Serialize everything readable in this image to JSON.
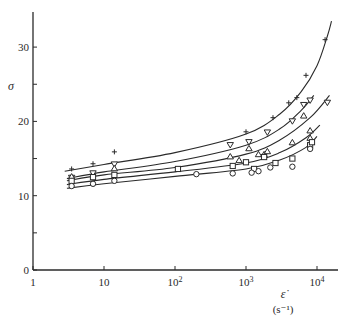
{
  "chart_data": {
    "type": "scatter",
    "title": "",
    "xlabel": "ε̇",
    "xlabel_unit": "(s⁻¹)",
    "ylabel": "σ",
    "xscale": "log",
    "xlim": [
      1,
      20000
    ],
    "ylim": [
      0,
      35
    ],
    "x_ticks": [
      {
        "value": 1,
        "label": "1"
      },
      {
        "value": 10,
        "label": "10"
      },
      {
        "value": 100,
        "label": "10",
        "sup": "2"
      },
      {
        "value": 1000,
        "label": "10",
        "sup": "3"
      },
      {
        "value": 10000,
        "label": "10",
        "sup": "4"
      }
    ],
    "y_ticks": [
      {
        "value": 0,
        "label": "0"
      },
      {
        "value": 5,
        "label": ""
      },
      {
        "value": 10,
        "label": "10"
      },
      {
        "value": 15,
        "label": ""
      },
      {
        "value": 20,
        "label": "20"
      },
      {
        "value": 25,
        "label": ""
      },
      {
        "value": 30,
        "label": "30"
      }
    ],
    "grid": false,
    "legend": "none",
    "series": [
      {
        "name": "plus",
        "marker": "+",
        "points": [
          [
            3.5,
            13.6
          ],
          [
            7,
            14.3
          ],
          [
            14,
            15.9
          ],
          [
            1000,
            18.6
          ],
          [
            2400,
            20.5
          ],
          [
            4000,
            22.5
          ],
          [
            5200,
            23.2
          ],
          [
            7000,
            26.2
          ],
          [
            13000,
            31.0
          ]
        ],
        "curve": [
          [
            2.8,
            13.3
          ],
          [
            10,
            14.2
          ],
          [
            100,
            15.8
          ],
          [
            1000,
            18.3
          ],
          [
            3000,
            21.0
          ],
          [
            6000,
            24.0
          ],
          [
            10000,
            27.5
          ],
          [
            14000,
            31.5
          ],
          [
            16000,
            33.5
          ]
        ]
      },
      {
        "name": "down-triangle",
        "marker": "▽",
        "points": [
          [
            3.5,
            12.4
          ],
          [
            7,
            13.0
          ],
          [
            14,
            14.2
          ],
          [
            600,
            16.8
          ],
          [
            1100,
            17.2
          ],
          [
            2000,
            18.5
          ],
          [
            4500,
            20.0
          ],
          [
            6500,
            22.2
          ],
          [
            8000,
            22.8
          ],
          [
            14000,
            22.5
          ]
        ],
        "curve": [
          [
            3,
            12.3
          ],
          [
            10,
            13.2
          ],
          [
            100,
            14.6
          ],
          [
            1000,
            16.8
          ],
          [
            3000,
            19.0
          ],
          [
            6000,
            21.5
          ],
          [
            9000,
            23.5
          ]
        ]
      },
      {
        "name": "up-triangle",
        "marker": "△",
        "points": [
          [
            3.5,
            12.6
          ],
          [
            14,
            13.7
          ],
          [
            600,
            15.3
          ],
          [
            800,
            14.8
          ],
          [
            1100,
            16.4
          ],
          [
            1500,
            15.6
          ],
          [
            1800,
            15.6
          ],
          [
            2000,
            16.0
          ],
          [
            4500,
            17.2
          ],
          [
            6500,
            20.8
          ],
          [
            8000,
            18.8
          ],
          [
            8000,
            17.8
          ]
        ],
        "curve": [
          [
            3,
            12.0
          ],
          [
            10,
            12.8
          ],
          [
            100,
            13.8
          ],
          [
            1000,
            15.6
          ],
          [
            3000,
            17.5
          ],
          [
            8000,
            20.5
          ],
          [
            15000,
            23.5
          ]
        ]
      },
      {
        "name": "square",
        "marker": "□",
        "points": [
          [
            3.5,
            12.0
          ],
          [
            7,
            12.5
          ],
          [
            14,
            12.8
          ],
          [
            110,
            13.6
          ],
          [
            650,
            14.0
          ],
          [
            1000,
            14.5
          ],
          [
            1300,
            13.6
          ],
          [
            1800,
            15.2
          ],
          [
            2600,
            14.4
          ],
          [
            4500,
            15.0
          ],
          [
            8000,
            16.8
          ],
          [
            8500,
            17.2
          ]
        ],
        "curve": [
          [
            3,
            11.5
          ],
          [
            10,
            12.2
          ],
          [
            100,
            13.2
          ],
          [
            1000,
            14.4
          ],
          [
            3000,
            15.8
          ],
          [
            7000,
            17.8
          ],
          [
            11000,
            19.5
          ]
        ]
      },
      {
        "name": "circle",
        "marker": "○",
        "points": [
          [
            3.5,
            11.3
          ],
          [
            7,
            11.6
          ],
          [
            14,
            12.0
          ],
          [
            200,
            12.9
          ],
          [
            650,
            13.0
          ],
          [
            1200,
            13.1
          ],
          [
            1500,
            13.3
          ],
          [
            2200,
            13.8
          ],
          [
            4500,
            13.9
          ],
          [
            8000,
            16.3
          ]
        ],
        "curve": [
          [
            3,
            11.0
          ],
          [
            10,
            11.6
          ],
          [
            100,
            12.6
          ],
          [
            1000,
            13.6
          ],
          [
            3000,
            14.8
          ],
          [
            7000,
            16.5
          ],
          [
            10000,
            18.0
          ]
        ]
      }
    ]
  }
}
